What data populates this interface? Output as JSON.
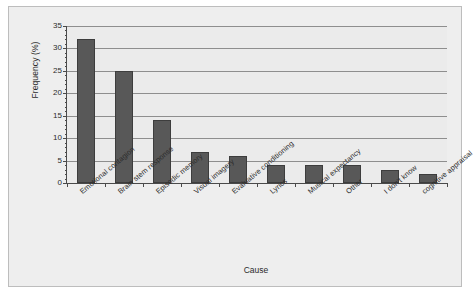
{
  "chart_data": {
    "type": "bar",
    "title": "",
    "xlabel": "Cause",
    "ylabel": "Frequency (%)",
    "categories": [
      "Emotional contagion",
      "Brain stem response",
      "Episodic memory",
      "Visual imagery",
      "Evaluative conditioning",
      "Lyrics",
      "Musical expectancy",
      "Other",
      "I don't know",
      "cognitive appraisal"
    ],
    "values": [
      32,
      25,
      14,
      7,
      6,
      4,
      4,
      4,
      3,
      2
    ],
    "ylim": [
      0,
      35
    ],
    "yticks": [
      0,
      5,
      10,
      15,
      20,
      25,
      30,
      35
    ],
    "ytick_labels": [
      "0",
      "5",
      "10",
      "15",
      "20",
      "25",
      "30",
      "35"
    ],
    "ytick_minor_step": 1,
    "grid": "horizontal",
    "legend": "none",
    "bar_color": "#585858",
    "plot_background": "#ebebeb",
    "panel_background": "#eeeeee",
    "axis_color": "#4a4a4a",
    "gridline_color": "#8e8e8e"
  }
}
